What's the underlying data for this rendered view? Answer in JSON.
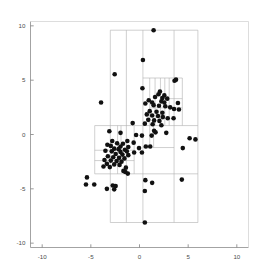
{
  "chart_data": {
    "type": "scatter",
    "title": "",
    "xlabel": "",
    "ylabel": "",
    "xlim": [
      -11.2,
      11.2
    ],
    "ylim": [
      -10.4,
      10.4
    ],
    "grid": false,
    "legend": null,
    "xticks": [
      -10,
      -5,
      0,
      5,
      10
    ],
    "yticks": [
      -10,
      -5,
      0,
      5,
      10
    ],
    "xtick_labels": [
      "-10",
      "-5",
      "0",
      "5",
      "10"
    ],
    "ytick_labels": [
      "-10",
      "-5",
      "0",
      "5",
      "10"
    ],
    "marker": {
      "shape": "circle",
      "color": "#111111",
      "size_px": 2.3
    },
    "partition": {
      "description": "recursive axis-aligned rectangular partition (k-d tree) overlay",
      "line_color": "#b0b0b0",
      "line_width": 0.6,
      "bounds": [
        -3.0,
        6.0,
        -8.1,
        9.6
      ],
      "vertical_lines": [
        {
          "x": -3.0,
          "y0": -8.1,
          "y1": 9.6
        },
        {
          "x": -1.35,
          "y0": -8.1,
          "y1": 9.6
        },
        {
          "x": 0.35,
          "y0": -8.1,
          "y1": 9.6
        },
        {
          "x": 3.55,
          "y0": -8.1,
          "y1": 9.6
        },
        {
          "x": 6.0,
          "y0": -8.1,
          "y1": 9.6
        },
        {
          "x": -4.6,
          "y0": -3.62,
          "y1": 0.82
        },
        {
          "x": -2.25,
          "y0": -3.62,
          "y1": 0.82
        },
        {
          "x": -0.55,
          "y0": -3.62,
          "y1": 0.82
        },
        {
          "x": -1.9,
          "y0": -2.4,
          "y1": 0.82
        },
        {
          "x": 1.05,
          "y0": 0.82,
          "y1": 5.2
        },
        {
          "x": 1.6,
          "y0": 0.82,
          "y1": 5.2
        },
        {
          "x": 2.15,
          "y0": 0.82,
          "y1": 5.2
        },
        {
          "x": 2.6,
          "y0": 0.82,
          "y1": 5.2
        },
        {
          "x": 3.05,
          "y0": 0.82,
          "y1": 5.2
        },
        {
          "x": 4.4,
          "y0": 0.82,
          "y1": 5.2
        },
        {
          "x": 1.05,
          "y0": -1.2,
          "y1": 0.82
        },
        {
          "x": 1.45,
          "y0": -1.2,
          "y1": 0.82
        }
      ],
      "horizontal_lines": [
        {
          "y": 9.6,
          "x0": -3.0,
          "x1": 6.0
        },
        {
          "y": -8.1,
          "x0": -3.0,
          "x1": 6.0
        },
        {
          "y": 0.82,
          "x0": -4.6,
          "x1": 6.0
        },
        {
          "y": -3.62,
          "x0": -4.6,
          "x1": 6.0
        },
        {
          "y": 5.2,
          "x0": 0.35,
          "x1": 4.4
        },
        {
          "y": 2.45,
          "x0": 1.05,
          "x1": 4.4
        },
        {
          "y": 3.3,
          "x0": 2.15,
          "x1": 4.4
        },
        {
          "y": -1.2,
          "x0": 0.35,
          "x1": 3.55
        },
        {
          "y": -1.45,
          "x0": -4.6,
          "x1": -0.55
        },
        {
          "y": -2.4,
          "x0": -4.6,
          "x1": -0.55
        }
      ]
    },
    "points": [
      [
        1.45,
        9.6
      ],
      [
        0.35,
        6.85
      ],
      [
        -2.55,
        5.55
      ],
      [
        3.75,
        5.05
      ],
      [
        3.6,
        4.95
      ],
      [
        0.3,
        4.25
      ],
      [
        2.1,
        3.95
      ],
      [
        1.95,
        3.7
      ],
      [
        2.55,
        3.6
      ],
      [
        1.6,
        3.45
      ],
      [
        2.35,
        3.35
      ],
      [
        2.85,
        3.3
      ],
      [
        -3.95,
        2.95
      ],
      [
        0.95,
        3.15
      ],
      [
        1.3,
        2.95
      ],
      [
        2.25,
        3.05
      ],
      [
        2.55,
        2.95
      ],
      [
        3.95,
        2.9
      ],
      [
        0.6,
        2.85
      ],
      [
        1.45,
        2.7
      ],
      [
        2.0,
        2.65
      ],
      [
        2.65,
        2.6
      ],
      [
        3.15,
        2.5
      ],
      [
        3.55,
        2.35
      ],
      [
        4.05,
        2.3
      ],
      [
        1.05,
        2.15
      ],
      [
        1.75,
        2.1
      ],
      [
        2.35,
        2.0
      ],
      [
        0.75,
        1.85
      ],
      [
        1.3,
        1.75
      ],
      [
        1.9,
        1.7
      ],
      [
        2.4,
        1.6
      ],
      [
        2.9,
        1.5
      ],
      [
        3.5,
        1.5
      ],
      [
        0.9,
        1.35
      ],
      [
        1.5,
        1.3
      ],
      [
        2.05,
        1.25
      ],
      [
        -0.7,
        1.05
      ],
      [
        0.55,
        1.0
      ],
      [
        1.35,
        0.95
      ],
      [
        2.25,
        0.85
      ],
      [
        -3.1,
        0.3
      ],
      [
        -1.95,
        0.15
      ],
      [
        1.5,
        0.35
      ],
      [
        1.65,
        0.2
      ],
      [
        2.75,
        0.15
      ],
      [
        -0.35,
        -0.05
      ],
      [
        0.25,
        -0.1
      ],
      [
        1.25,
        -0.1
      ],
      [
        5.75,
        -0.45
      ],
      [
        5.15,
        -0.35
      ],
      [
        -2.8,
        -0.6
      ],
      [
        -1.25,
        -0.6
      ],
      [
        -0.6,
        -0.75
      ],
      [
        -2.3,
        -0.8
      ],
      [
        -1.7,
        -0.85
      ],
      [
        -3.3,
        -0.95
      ],
      [
        -2.95,
        -1.05
      ],
      [
        -1.95,
        -1.1
      ],
      [
        -1.15,
        -1.15
      ],
      [
        0.65,
        -1.1
      ],
      [
        1.1,
        -1.1
      ],
      [
        -0.05,
        -1.25
      ],
      [
        -2.6,
        -1.3
      ],
      [
        -2.15,
        -1.35
      ],
      [
        -1.5,
        -1.4
      ],
      [
        -3.5,
        -1.5
      ],
      [
        -2.85,
        -1.55
      ],
      [
        -1.95,
        -1.6
      ],
      [
        -1.3,
        -1.55
      ],
      [
        4.45,
        -1.25
      ],
      [
        -0.55,
        -1.65
      ],
      [
        -2.45,
        -1.8
      ],
      [
        -1.75,
        -1.85
      ],
      [
        -1.15,
        -1.9
      ],
      [
        -3.25,
        -2.0
      ],
      [
        -2.7,
        -2.1
      ],
      [
        -2.1,
        -2.15
      ],
      [
        -1.55,
        -2.2
      ],
      [
        0.25,
        -1.65
      ],
      [
        -3.6,
        -2.35
      ],
      [
        -2.95,
        -2.4
      ],
      [
        -2.35,
        -2.45
      ],
      [
        -1.85,
        -2.5
      ],
      [
        -3.35,
        -2.7
      ],
      [
        -2.6,
        -2.75
      ],
      [
        -2.05,
        -2.8
      ],
      [
        -3.7,
        -2.95
      ],
      [
        -3.05,
        -3.0
      ],
      [
        -1.4,
        -3.05
      ],
      [
        -1.65,
        -3.35
      ],
      [
        -1.45,
        -3.45
      ],
      [
        -1.2,
        -3.6
      ],
      [
        -5.4,
        -3.95
      ],
      [
        0.6,
        -4.2
      ],
      [
        4.35,
        -4.15
      ],
      [
        1.3,
        -4.45
      ],
      [
        -5.5,
        -4.6
      ],
      [
        -4.65,
        -4.6
      ],
      [
        -2.75,
        -4.7
      ],
      [
        -2.45,
        -4.75
      ],
      [
        -3.35,
        -5.0
      ],
      [
        -2.6,
        -5.05
      ],
      [
        0.55,
        -5.2
      ],
      [
        0.55,
        -8.1
      ]
    ],
    "n_points": 106
  },
  "axes": {
    "spine_color": "#999999",
    "tick_color": "#808080",
    "label_color": "#4d4d4d",
    "background": "#ffffff"
  }
}
